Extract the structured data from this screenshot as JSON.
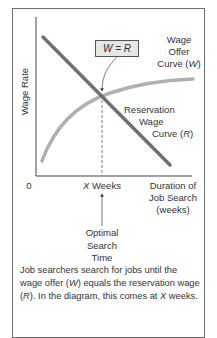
{
  "diagram": {
    "y_axis_label": "Wage Rate",
    "x_axis_label_lines": [
      "Duration of",
      "Job Search",
      "(weeks)"
    ],
    "origin_label": "0",
    "x_marker_var": "X",
    "x_marker_label": " Weeks",
    "equality_box": "W = R",
    "wage_offer_curve_lines": [
      "Wage",
      "Offer",
      "Curve (",
      "W",
      ")"
    ],
    "reservation_curve_lines": [
      "Reservation",
      "Wage",
      "Curve (",
      "R",
      ")"
    ],
    "optimal_label_lines": [
      "Optimal",
      "Search",
      "Time"
    ],
    "colors": {
      "reservation_line": "#707070",
      "wage_offer_curve": "#b0b0b0",
      "axis": "#444444",
      "frame": "#6f6f6f",
      "box_fill": "#e6e6e6"
    }
  },
  "caption": {
    "part1": "Job searchers search for jobs until the wage offer (",
    "w": "W",
    "part2": ") equals the reservation wage (",
    "r": "R",
    "part3": "). In the diagram, this comes at ",
    "x": "X",
    "part4": " weeks."
  }
}
